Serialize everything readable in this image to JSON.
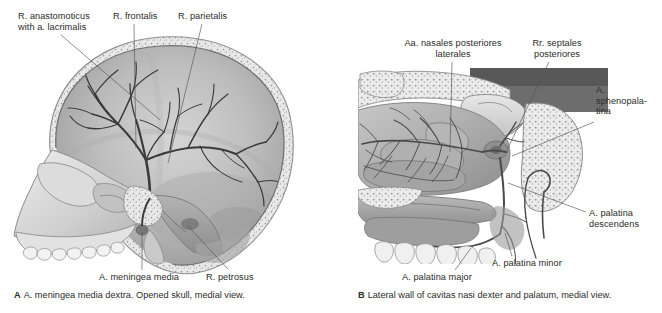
{
  "plate": {
    "background": "#ffffff",
    "ink": "#2b2b2b",
    "leader_color": "#55555a"
  },
  "figures": [
    {
      "id": "A",
      "letter": "A",
      "caption": "A. meningea media dextra. Opened skull, medial view.",
      "subject": "sagittal-hemisected-skull-with-middle-meningeal-artery",
      "view": "medial view",
      "labels": [
        {
          "name": "r-anastomoticus",
          "text": "R. anastomoticus\nwith a. lacrimalis",
          "align": "left",
          "x": 18,
          "y": 11,
          "leader": [
            [
              61,
              35
            ],
            [
              160,
              120
            ]
          ]
        },
        {
          "name": "r-frontalis",
          "text": "R. frontalis",
          "align": "left",
          "x": 113,
          "y": 11,
          "leader": [
            [
              134,
              24
            ],
            [
              136,
              148
            ]
          ]
        },
        {
          "name": "r-parietalis",
          "text": "R. parietalis",
          "align": "left",
          "x": 178,
          "y": 11,
          "leader": [
            [
              202,
              24
            ],
            [
              168,
              163
            ]
          ]
        },
        {
          "name": "a-meningea-media",
          "text": "A. meningea media",
          "align": "left",
          "x": 99,
          "y": 272,
          "leader": [
            [
              142,
              270
            ],
            [
              142,
              232
            ]
          ]
        },
        {
          "name": "r-petrosus",
          "text": "R. petrosus",
          "align": "left",
          "x": 206,
          "y": 272,
          "leader": [
            [
              228,
              269
            ],
            [
              188,
              226
            ]
          ]
        }
      ]
    },
    {
      "id": "B",
      "letter": "B",
      "caption": "Lateral wall of cavitas nasi dexter and palatum, medial view.",
      "subject": "lateral-nasal-wall-and-palate-arteries",
      "view": "medial view",
      "labels": [
        {
          "name": "aa-nasales-posteriores-laterales",
          "text": "Aa. nasales posteriores\nlaterales",
          "align": "center",
          "x": 393,
          "y": 38,
          "width": 120,
          "leader": [
            [
              452,
              62
            ],
            [
              450,
              152
            ]
          ]
        },
        {
          "name": "rr-septales-posteriores",
          "text": "Rr. septales\nposteriores",
          "align": "center",
          "x": 522,
          "y": 38,
          "width": 70,
          "leader": [
            [
              549,
              62
            ],
            [
              508,
              148
            ]
          ]
        },
        {
          "name": "a-sphenopalatina",
          "text": "A.\nsphenopala-\ntina",
          "align": "left",
          "x": 596,
          "y": 85,
          "leader": [
            [
              594,
              122
            ],
            [
              512,
              156
            ]
          ]
        },
        {
          "name": "a-palatina-descendens",
          "text": "A. palatina\ndescendens",
          "align": "left",
          "x": 589,
          "y": 208,
          "leader": [
            [
              586,
              212
            ],
            [
              508,
              183
            ]
          ]
        },
        {
          "name": "a-palatina-minor",
          "text": "A. palatina minor",
          "align": "left",
          "x": 492,
          "y": 258,
          "leader": [
            [
              512,
              256
            ],
            [
              505,
              233
            ]
          ]
        },
        {
          "name": "a-palatina-major",
          "text": "A. palatina major",
          "align": "left",
          "x": 402,
          "y": 272,
          "leader": [
            [
              455,
              270
            ],
            [
              471,
              248
            ]
          ]
        }
      ]
    }
  ]
}
